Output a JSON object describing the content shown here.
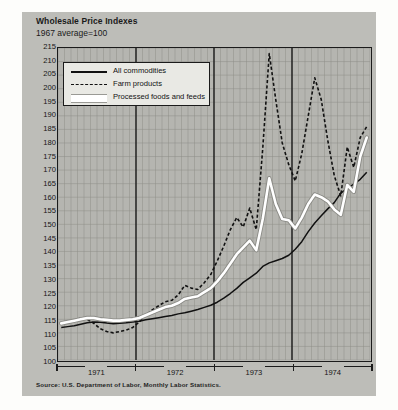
{
  "title": "Wholesale Price Indexes",
  "subtitle": "1967 average=100",
  "source": "Source: U.S. Department of Labor, Monthly Labor Statistics.",
  "legend": {
    "items": [
      {
        "label": "All commodities",
        "style": "solid",
        "color": "#111111"
      },
      {
        "label": "Farm products",
        "style": "dashed",
        "color": "#111111"
      },
      {
        "label": "Processed foods and feeds",
        "style": "band",
        "color": "#ffffff"
      }
    ]
  },
  "chart_data": {
    "type": "line",
    "title": "Wholesale Price Indexes",
    "subtitle": "1967 average=100",
    "xlabel": "",
    "ylabel": "Index (1967=100)",
    "ylim": [
      100,
      215
    ],
    "ytick_step": 5,
    "yticks": [
      100,
      105,
      110,
      115,
      120,
      125,
      130,
      135,
      140,
      145,
      150,
      155,
      160,
      165,
      170,
      175,
      180,
      185,
      190,
      195,
      200,
      205,
      210,
      215
    ],
    "grid": true,
    "legend_position": "upper-left",
    "x_years": [
      "1971",
      "1972",
      "1973",
      "1974"
    ],
    "x_unit": "month",
    "x_count": 48,
    "series": [
      {
        "name": "All commodities",
        "style": "solid",
        "color": "#111111",
        "values": [
          112.0,
          112.3,
          112.6,
          113.2,
          113.7,
          114.0,
          113.9,
          113.6,
          113.4,
          113.5,
          113.7,
          114.0,
          114.3,
          114.8,
          115.2,
          115.6,
          116.0,
          116.4,
          117.0,
          117.4,
          118.0,
          118.6,
          119.4,
          120.2,
          121.3,
          122.8,
          124.5,
          126.4,
          128.6,
          130.3,
          132.0,
          134.5,
          135.8,
          136.6,
          137.4,
          138.6,
          140.8,
          143.6,
          147.3,
          150.5,
          153.2,
          155.7,
          158.0,
          161.5,
          163.2,
          164.8,
          166.6,
          169.2
        ]
      },
      {
        "name": "Farm products",
        "style": "dashed",
        "color": "#111111",
        "values": [
          113.5,
          114.0,
          114.5,
          115.5,
          115.0,
          113.5,
          111.5,
          110.5,
          110.0,
          110.5,
          111.0,
          112.0,
          114.0,
          116.5,
          118.5,
          120.0,
          121.5,
          122.0,
          124.0,
          127.5,
          126.5,
          126.0,
          128.5,
          131.5,
          136.5,
          142.0,
          148.0,
          152.5,
          149.0,
          156.0,
          148.0,
          178.0,
          213.0,
          196.0,
          180.0,
          172.0,
          166.0,
          176.0,
          190.0,
          204.0,
          196.0,
          181.0,
          168.0,
          160.5,
          178.5,
          171.0,
          182.0,
          186.0
        ]
      },
      {
        "name": "Processed foods and feeds",
        "style": "band",
        "color": "#ffffff",
        "values": [
          113.5,
          114.0,
          114.5,
          115.0,
          115.5,
          115.5,
          115.0,
          114.8,
          114.5,
          114.5,
          114.8,
          115.0,
          115.5,
          116.5,
          117.5,
          118.5,
          119.5,
          120.0,
          121.0,
          122.5,
          123.0,
          123.5,
          125.0,
          126.5,
          129.0,
          132.0,
          135.5,
          139.0,
          141.5,
          144.0,
          140.5,
          152.0,
          167.0,
          157.5,
          152.0,
          151.5,
          148.5,
          152.5,
          157.5,
          161.0,
          160.0,
          158.5,
          155.5,
          153.5,
          164.5,
          162.0,
          175.0,
          182.0
        ]
      }
    ]
  }
}
